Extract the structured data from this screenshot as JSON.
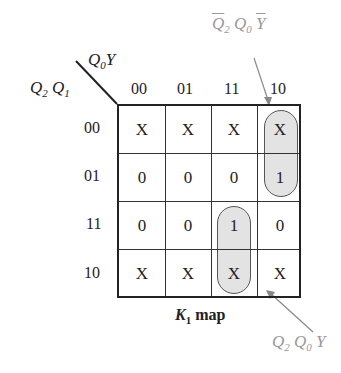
{
  "diagram": {
    "type": "karnaugh_map",
    "title": "K1 map",
    "title_main": "K",
    "title_sub": "1",
    "title_rest": " map",
    "row_variables": "Q2 Q1",
    "col_variables": "Q0 Y",
    "col_headers": [
      "00",
      "01",
      "11",
      "10"
    ],
    "row_headers": [
      "00",
      "01",
      "11",
      "10"
    ],
    "cells": [
      [
        "X",
        "X",
        "X",
        "X"
      ],
      [
        "0",
        "0",
        "0",
        "1"
      ],
      [
        "0",
        "0",
        "1",
        "0"
      ],
      [
        "X",
        "X",
        "X",
        "X"
      ]
    ],
    "groups": [
      {
        "term": "Q̄2 Q0 Ȳ",
        "cells": "rows 00-01, col 10"
      },
      {
        "term": "Q2 Q0 Y",
        "cells": "rows 11-10, col 11"
      }
    ],
    "annotations": {
      "top": {
        "q2": "Q",
        "q2_sub": "2",
        "q0": "Q",
        "q0_sub": "0",
        "y": "Y"
      },
      "bottom": {
        "q2": "Q",
        "q2_sub": "2",
        "q0": "Q",
        "q0_sub": "0",
        "y": "Y"
      }
    }
  }
}
